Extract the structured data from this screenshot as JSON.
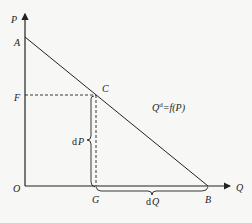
{
  "diagram": {
    "type": "demand-curve",
    "axes": {
      "y_label": "P",
      "x_label": "Q",
      "origin_label": "O"
    },
    "points": {
      "A": "A",
      "B": "B",
      "C": "C",
      "F": "F",
      "G": "G"
    },
    "braces": {
      "vertical": {
        "d": "d",
        "var": "P"
      },
      "horizontal": {
        "d": "d",
        "var": "Q"
      }
    },
    "curve_label": {
      "base": "Q",
      "sup": "d",
      "rest": "=f(P)"
    },
    "colors": {
      "line": "#222222",
      "background": "#f7f7f5"
    }
  }
}
